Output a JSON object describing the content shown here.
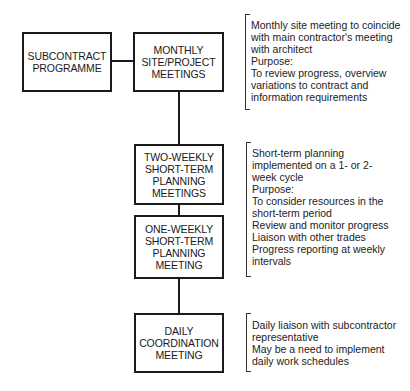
{
  "diagram": {
    "boxes": {
      "subcontract": "SUBCONTRACT\nPROGRAMME",
      "monthly": "MONTHLY\nSITE/PROJECT\nMEETINGS",
      "two_weekly": "TWO-WEEKLY\nSHORT-TERM\nPLANNING\nMEETINGS",
      "one_weekly": "ONE-WEEKLY\nSHORT-TERM\nPLANNING\nMEETING",
      "daily": "DAILY\nCOORDINATION\nMEETING"
    },
    "notes": {
      "monthly": "Monthly site meeting to coincide\nwith main contractor's meeting\nwith architect\nPurpose:\nTo review progress, overview\nvariations to contract and\ninformation requirements",
      "short_term": "Short-term planning\nimplemented on a 1- or 2-\nweek cycle\nPurpose:\nTo consider resources in the\nshort-term period\nReview and monitor progress\nLiaison with other trades\nProgress reporting at weekly\nintervals",
      "daily": "Daily liaison with subcontractor\nrepresentative\nMay be a need to implement\ndaily work schedules"
    }
  }
}
